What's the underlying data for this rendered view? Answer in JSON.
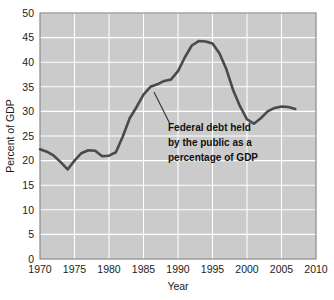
{
  "chart_data": {
    "type": "line",
    "title": "",
    "xlabel": "Year",
    "ylabel": "Percent of GDP",
    "xlim": [
      1970,
      2010
    ],
    "ylim": [
      0,
      50
    ],
    "grid": true,
    "legend_position": "none",
    "x_ticks": [
      "1970",
      "1975",
      "1980",
      "1985",
      "1990",
      "1995",
      "2000",
      "2005",
      "2010"
    ],
    "y_ticks": [
      "0",
      "5",
      "10",
      "15",
      "20",
      "25",
      "30",
      "35",
      "40",
      "45",
      "50"
    ],
    "series": [
      {
        "name": "Federal debt held by the public as a percentage of GDP",
        "color": "#4a4a4a",
        "x": [
          1970,
          1971,
          1972,
          1973,
          1974,
          1975,
          1976,
          1977,
          1978,
          1979,
          1980,
          1981,
          1982,
          1983,
          1984,
          1985,
          1986,
          1987,
          1988,
          1989,
          1990,
          1991,
          1992,
          1993,
          1994,
          1995,
          1996,
          1997,
          1998,
          1999,
          2000,
          2001,
          2002,
          2003,
          2004,
          2005,
          2006,
          2007
        ],
        "values": [
          22.3,
          21.8,
          21.0,
          19.7,
          18.2,
          20.0,
          21.5,
          22.1,
          22.0,
          20.9,
          21.0,
          21.7,
          24.9,
          28.6,
          30.9,
          33.4,
          35.0,
          35.5,
          36.2,
          36.5,
          38.2,
          41.0,
          43.4,
          44.3,
          44.2,
          43.8,
          41.8,
          38.6,
          34.3,
          31.0,
          28.4,
          27.5,
          28.6,
          30.0,
          30.7,
          31.0,
          30.9,
          30.5
        ]
      }
    ],
    "annotation": {
      "lines": [
        "Federal debt held",
        "by the public as a",
        "percentage of GDP"
      ],
      "leader_from": [
        154,
        92
      ],
      "leader_to": [
        170,
        124
      ]
    }
  },
  "colors": {
    "plot_background": "#cbcbcb",
    "gridline": "#ffffff",
    "line": "#4a4a4a",
    "border": "#8a8a8a",
    "text": "#1b1b1b",
    "page_background": "#ffffff"
  }
}
